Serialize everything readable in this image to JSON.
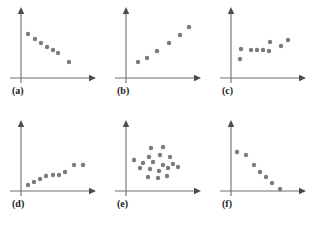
{
  "figure": {
    "title": "",
    "background_color": "#ffffff",
    "dot_color": "#7a7a80",
    "axis_color": "#6e6e73",
    "label_color": "#1a1a1a",
    "panel_width": 105,
    "panel_height": 113,
    "columns": 3,
    "rows": 2
  },
  "panels": [
    {
      "label": "(a)",
      "col": 0,
      "row": 0,
      "label_x": 12,
      "label_y": 86
    },
    {
      "label": "(b)",
      "col": 1,
      "row": 0,
      "label_x": 12,
      "label_y": 86
    },
    {
      "label": "(c)",
      "col": 2,
      "row": 0,
      "label_x": 12,
      "label_y": 86
    },
    {
      "label": "(d)",
      "col": 0,
      "row": 1,
      "label_x": 12,
      "label_y": 86
    },
    {
      "label": "(e)",
      "col": 1,
      "row": 1,
      "label_x": 12,
      "label_y": 86
    },
    {
      "label": "(f)",
      "col": 2,
      "row": 1,
      "label_x": 12,
      "label_y": 86
    }
  ],
  "chart_data": [
    {
      "type": "scatter",
      "panel": "(a)",
      "title": "(a)",
      "xlabel": "",
      "ylabel": "",
      "relationship": "strong negative linear",
      "grid": false,
      "legend": "none",
      "axes": {
        "origin_x": 21,
        "origin_y": 78,
        "x_end": 95,
        "y_top": 8
      },
      "xlim": [
        0,
        105
      ],
      "ylim": [
        0,
        113
      ],
      "points": [
        {
          "x": 28,
          "y": 34
        },
        {
          "x": 35,
          "y": 39
        },
        {
          "x": 41,
          "y": 43
        },
        {
          "x": 47,
          "y": 47
        },
        {
          "x": 53,
          "y": 50
        },
        {
          "x": 58,
          "y": 53
        },
        {
          "x": 69,
          "y": 62
        }
      ]
    },
    {
      "type": "scatter",
      "panel": "(b)",
      "title": "(b)",
      "xlabel": "",
      "ylabel": "",
      "relationship": "strong positive linear",
      "grid": false,
      "legend": "none",
      "axes": {
        "origin_x": 21,
        "origin_y": 78,
        "x_end": 95,
        "y_top": 8
      },
      "xlim": [
        0,
        105
      ],
      "ylim": [
        0,
        113
      ],
      "points": [
        {
          "x": 33,
          "y": 62
        },
        {
          "x": 42,
          "y": 58
        },
        {
          "x": 52,
          "y": 51
        },
        {
          "x": 64,
          "y": 43
        },
        {
          "x": 75,
          "y": 35
        },
        {
          "x": 84,
          "y": 27
        }
      ]
    },
    {
      "type": "scatter",
      "panel": "(c)",
      "title": "(c)",
      "xlabel": "",
      "ylabel": "",
      "relationship": "weak positive / no clear trend",
      "grid": false,
      "legend": "none",
      "axes": {
        "origin_x": 21,
        "origin_y": 78,
        "x_end": 95,
        "y_top": 8
      },
      "xlim": [
        0,
        105
      ],
      "ylim": [
        0,
        113
      ],
      "points": [
        {
          "x": 31,
          "y": 49
        },
        {
          "x": 30,
          "y": 59
        },
        {
          "x": 41,
          "y": 50
        },
        {
          "x": 47,
          "y": 50
        },
        {
          "x": 53,
          "y": 50
        },
        {
          "x": 59,
          "y": 51
        },
        {
          "x": 60,
          "y": 42
        },
        {
          "x": 71,
          "y": 46
        },
        {
          "x": 78,
          "y": 40
        }
      ]
    },
    {
      "type": "scatter",
      "panel": "(d)",
      "title": "(d)",
      "xlabel": "",
      "ylabel": "",
      "relationship": "moderate positive curved",
      "grid": false,
      "legend": "none",
      "axes": {
        "origin_x": 21,
        "origin_y": 78,
        "x_end": 95,
        "y_top": 8
      },
      "xlim": [
        0,
        105
      ],
      "ylim": [
        0,
        113
      ],
      "points": [
        {
          "x": 28,
          "y": 72
        },
        {
          "x": 34,
          "y": 69
        },
        {
          "x": 40,
          "y": 66
        },
        {
          "x": 46,
          "y": 63
        },
        {
          "x": 53,
          "y": 62
        },
        {
          "x": 59,
          "y": 62
        },
        {
          "x": 65,
          "y": 59
        },
        {
          "x": 74,
          "y": 52
        },
        {
          "x": 83,
          "y": 52
        }
      ]
    },
    {
      "type": "scatter",
      "panel": "(e)",
      "title": "(e)",
      "xlabel": "",
      "ylabel": "",
      "relationship": "no correlation (random cloud)",
      "grid": false,
      "legend": "none",
      "axes": {
        "origin_x": 21,
        "origin_y": 78,
        "x_end": 95,
        "y_top": 8
      },
      "xlim": [
        0,
        105
      ],
      "ylim": [
        0,
        113
      ],
      "points": [
        {
          "x": 46,
          "y": 35
        },
        {
          "x": 58,
          "y": 34
        },
        {
          "x": 44,
          "y": 44
        },
        {
          "x": 55,
          "y": 42
        },
        {
          "x": 65,
          "y": 44
        },
        {
          "x": 29,
          "y": 47
        },
        {
          "x": 38,
          "y": 50
        },
        {
          "x": 48,
          "y": 49
        },
        {
          "x": 58,
          "y": 52
        },
        {
          "x": 68,
          "y": 51
        },
        {
          "x": 35,
          "y": 55
        },
        {
          "x": 45,
          "y": 56
        },
        {
          "x": 54,
          "y": 58
        },
        {
          "x": 63,
          "y": 55
        },
        {
          "x": 73,
          "y": 54
        },
        {
          "x": 43,
          "y": 64
        },
        {
          "x": 53,
          "y": 65
        },
        {
          "x": 62,
          "y": 63
        }
      ]
    },
    {
      "type": "scatter",
      "panel": "(f)",
      "title": "(f)",
      "xlabel": "",
      "ylabel": "",
      "relationship": "strong negative curved",
      "grid": false,
      "legend": "none",
      "axes": {
        "origin_x": 21,
        "origin_y": 78,
        "x_end": 95,
        "y_top": 8
      },
      "xlim": [
        0,
        105
      ],
      "ylim": [
        0,
        113
      ],
      "points": [
        {
          "x": 27,
          "y": 39
        },
        {
          "x": 36,
          "y": 42
        },
        {
          "x": 44,
          "y": 52
        },
        {
          "x": 50,
          "y": 59
        },
        {
          "x": 56,
          "y": 64
        },
        {
          "x": 62,
          "y": 70
        },
        {
          "x": 70,
          "y": 76
        }
      ]
    }
  ]
}
